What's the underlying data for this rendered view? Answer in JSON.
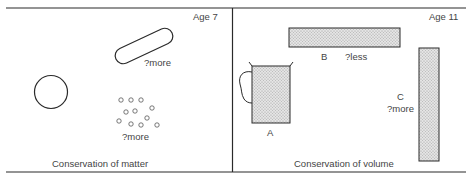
{
  "figure": {
    "panels": [
      {
        "id": "left",
        "age_label": "Age 7",
        "caption": "Conservation of matter",
        "annotations": {
          "rod": "?more",
          "pieces": "?more"
        },
        "shapes": [
          "ball",
          "rolled-sausage",
          "broken-pieces"
        ]
      },
      {
        "id": "right",
        "age_label": "Age 11",
        "caption": "Conservation of volume",
        "containers": [
          {
            "id": "A",
            "label": "A",
            "annotation": ""
          },
          {
            "id": "B",
            "label": "B",
            "annotation": "?less"
          },
          {
            "id": "C",
            "label": "C",
            "annotation": "?more"
          }
        ]
      }
    ],
    "colors": {
      "line": "#2a2a2a",
      "fill_stipple": "#d6d6d6",
      "text": "#444444"
    }
  }
}
